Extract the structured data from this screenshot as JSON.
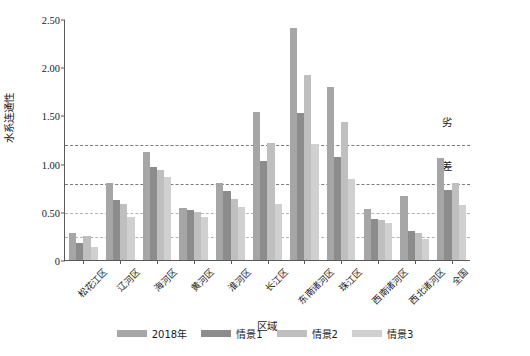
{
  "chart_data": {
    "type": "bar",
    "title": "",
    "xlabel": "区域",
    "ylabel": "水系连通性",
    "ylim": [
      0,
      2.5
    ],
    "yticks": [
      0,
      0.5,
      1.0,
      1.5,
      2.0,
      2.5
    ],
    "ytick_labels": [
      "0",
      "0.50",
      "1.00",
      "1.50",
      "2.00",
      "2.50"
    ],
    "grid": false,
    "legend_position": "bottom",
    "categories": [
      "松花江区",
      "辽河区",
      "海河区",
      "黄河区",
      "淮河区",
      "长江区",
      "东南诸河区",
      "珠江区",
      "西南诸河区",
      "西北诸河区",
      "全国"
    ],
    "series": [
      {
        "name": "2018年",
        "color": "#a6a6a6",
        "values": [
          0.28,
          0.8,
          1.12,
          0.54,
          0.8,
          1.54,
          2.41,
          1.79,
          0.53,
          0.66,
          1.06
        ]
      },
      {
        "name": "情景1",
        "color": "#8c8c8c",
        "values": [
          0.18,
          0.62,
          0.97,
          0.52,
          0.72,
          1.03,
          1.52,
          1.07,
          0.43,
          0.3,
          0.73
        ]
      },
      {
        "name": "情景2",
        "color": "#bfbfbf",
        "values": [
          0.25,
          0.58,
          0.93,
          0.5,
          0.63,
          1.21,
          1.92,
          1.43,
          0.42,
          0.28,
          0.8
        ]
      },
      {
        "name": "情景3",
        "color": "#d0d0d0",
        "values": [
          0.13,
          0.45,
          0.86,
          0.45,
          0.55,
          0.58,
          1.2,
          0.84,
          0.38,
          0.22,
          0.57
        ]
      }
    ],
    "thresholds": [
      {
        "value": 1.2,
        "style": "dark"
      },
      {
        "value": 0.8,
        "style": "dark"
      },
      {
        "value": 0.5,
        "style": "light"
      },
      {
        "value": 0.25,
        "style": "light"
      }
    ],
    "grade_labels": [
      {
        "text": "劣",
        "at": 1.45
      },
      {
        "text": "差",
        "at": 1.0
      },
      {
        "text": "中",
        "at": 0.65
      },
      {
        "text": "良",
        "at": 0.37
      },
      {
        "text": "优",
        "at": 0.12
      }
    ]
  }
}
